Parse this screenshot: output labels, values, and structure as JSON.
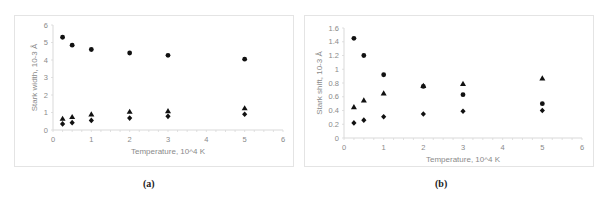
{
  "chart_data": [
    {
      "type": "scatter",
      "panel_label": "(a)",
      "title": "",
      "xlabel": "Temperature, 10^4 K",
      "ylabel": "Stark width, 10-3 Å",
      "xlim": [
        0,
        6
      ],
      "ylim": [
        0,
        6
      ],
      "xticks": [
        "0",
        "1",
        "2",
        "3",
        "4",
        "5",
        "6"
      ],
      "yticks": [
        "0",
        "1",
        "2",
        "3",
        "4",
        "5",
        "6"
      ],
      "grid": false,
      "legend": "none",
      "x": [
        0.25,
        0.5,
        1,
        2,
        3,
        5
      ],
      "series": [
        {
          "name": "circle",
          "marker": "circle",
          "values": [
            5.3,
            4.85,
            4.6,
            4.4,
            4.27,
            4.05
          ]
        },
        {
          "name": "triangle",
          "marker": "triangle",
          "values": [
            0.65,
            0.75,
            0.9,
            1.05,
            1.08,
            1.25
          ]
        },
        {
          "name": "diamond",
          "marker": "diamond",
          "values": [
            0.35,
            0.42,
            0.55,
            0.68,
            0.78,
            0.9
          ]
        }
      ]
    },
    {
      "type": "scatter",
      "panel_label": "(b)",
      "title": "",
      "xlabel": "Temperature, 10^4 K",
      "ylabel": "Stark shift, 10-3 Å",
      "xlim": [
        0,
        6
      ],
      "ylim": [
        0,
        1.6
      ],
      "xticks": [
        "0",
        "1",
        "2",
        "3",
        "4",
        "5",
        "6"
      ],
      "yticks": [
        "0",
        "0.2",
        "0.4",
        "0.6",
        "0.8",
        "1",
        "1.2",
        "1.4",
        "1.6"
      ],
      "grid": false,
      "legend": "none",
      "x": [
        0.25,
        0.5,
        1,
        2,
        3,
        5
      ],
      "series": [
        {
          "name": "circle",
          "marker": "circle",
          "values": [
            1.45,
            1.2,
            0.92,
            0.75,
            0.63,
            0.5
          ]
        },
        {
          "name": "triangle",
          "marker": "triangle",
          "values": [
            0.45,
            0.55,
            0.65,
            0.76,
            0.79,
            0.87
          ]
        },
        {
          "name": "diamond",
          "marker": "diamond",
          "values": [
            0.22,
            0.26,
            0.31,
            0.35,
            0.39,
            0.4
          ]
        }
      ]
    }
  ],
  "captions": {
    "a": "(a)",
    "b": "(b)"
  },
  "colors": {
    "marker": "#111111",
    "axis": "#d9d9d9",
    "text": "#8a8a8a"
  }
}
